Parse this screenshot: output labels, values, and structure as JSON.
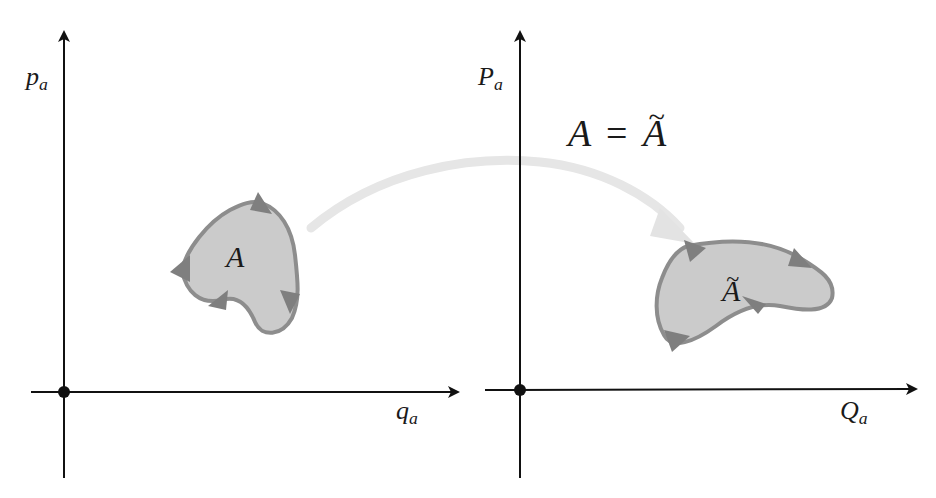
{
  "figure": {
    "colors": {
      "axis": "#111111",
      "region_fill": "#c9c9c9",
      "region_stroke": "#8a8a8a",
      "orientation_arrows": "#7f7f7f",
      "mapping_arrow": "#e6e6e6",
      "background": "#ffffff"
    }
  },
  "left_plot": {
    "y_axis_label": {
      "base": "p",
      "sub": "a"
    },
    "x_axis_label": {
      "base": "q",
      "sub": "a"
    },
    "region_label": "A"
  },
  "right_plot": {
    "y_axis_label": {
      "base": "P",
      "sub": "a"
    },
    "x_axis_label": {
      "base": "Q",
      "sub": "a"
    },
    "region_label": "A",
    "region_label_accent": "~"
  },
  "equation": {
    "lhs": "A",
    "op": "=",
    "rhs": "A",
    "rhs_accent": "~"
  }
}
